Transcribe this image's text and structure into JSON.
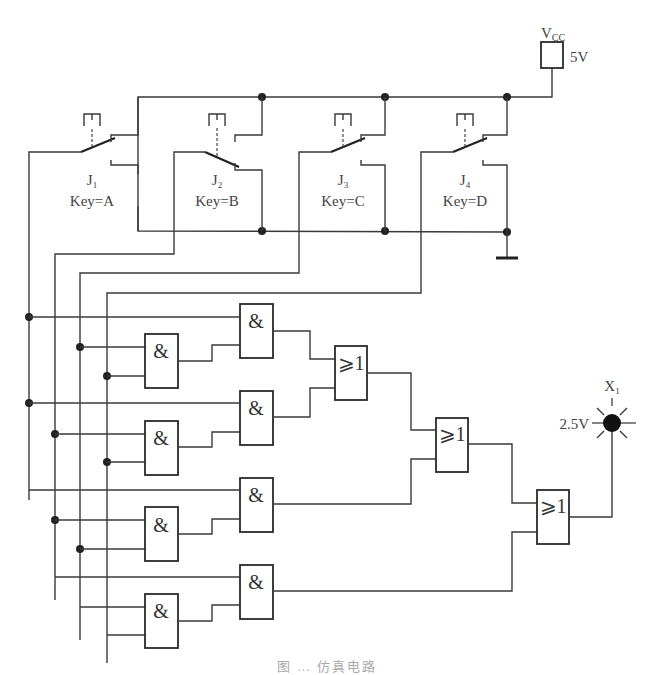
{
  "diagram": {
    "type": "logic-circuit-simulation",
    "power": {
      "name": "VCC",
      "label_main": "V",
      "label_sub": "CC",
      "voltage": "5V"
    },
    "switches": [
      {
        "id": "J1",
        "label_main": "J",
        "label_sub": "1",
        "key": "Key=A",
        "state": "closed"
      },
      {
        "id": "J2",
        "label_main": "J",
        "label_sub": "2",
        "key": "Key=B",
        "state": "open"
      },
      {
        "id": "J3",
        "label_main": "J",
        "label_sub": "3",
        "key": "Key=C",
        "state": "closed"
      },
      {
        "id": "J4",
        "label_main": "J",
        "label_sub": "4",
        "key": "Key=D",
        "state": "closed"
      }
    ],
    "and_gate_symbol": "&",
    "or_gate_symbol": "⩾1",
    "gates": {
      "and_count": 8,
      "or_count": 3
    },
    "probe": {
      "name": "X1",
      "label_main": "X",
      "label_sub": "1",
      "voltage": "2.5V",
      "state": "lit"
    },
    "ground": "ground"
  },
  "caption": "图 … 仿真电路",
  "colors": {
    "wire": "#3a3a3a",
    "background": "#ffffff",
    "probe": "#111111"
  }
}
